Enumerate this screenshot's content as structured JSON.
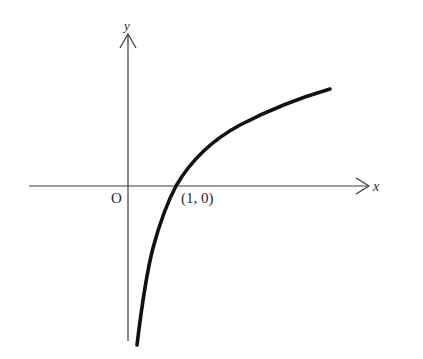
{
  "diagram": {
    "type": "function-graph",
    "function": "y = log_a(x), a > 1",
    "axes": {
      "x_label": "x",
      "y_label": "y",
      "origin_label": "O"
    },
    "points": [
      {
        "label": "(1, 0)",
        "x": 1,
        "y": 0
      }
    ],
    "colors": {
      "axis": "#3a3a3a",
      "curve": "#111111",
      "text": "#2a2a2a"
    }
  }
}
